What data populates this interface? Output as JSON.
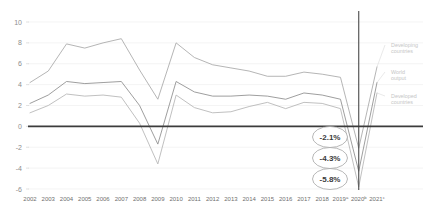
{
  "chart_data": {
    "type": "line",
    "title": "",
    "xlabel": "",
    "ylabel": "",
    "ylim": [
      -6,
      10
    ],
    "yticks": [
      10,
      8,
      6,
      4,
      2,
      0,
      -2,
      -4,
      -6
    ],
    "grid": true,
    "legend_position": "right",
    "categories": [
      "2002",
      "2003",
      "2004",
      "2005",
      "2006",
      "2007",
      "2008",
      "2009",
      "2010",
      "2011",
      "2012",
      "2013",
      "2014",
      "2015",
      "2016",
      "2017",
      "2018",
      "2019",
      "2020",
      "2021"
    ],
    "tick_labels": [
      "2002",
      "2003",
      "2004",
      "2005",
      "2006",
      "2007",
      "2008",
      "2009",
      "2010",
      "2011",
      "2012",
      "2013",
      "2014",
      "2015",
      "2016",
      "2017",
      "2018",
      "2019",
      "2020",
      "2021"
    ],
    "tick_superscripts": [
      "",
      "",
      "",
      "",
      "",
      "",
      "",
      "",
      "",
      "",
      "",
      "",
      "",
      "",
      "",
      "",
      "",
      "a",
      "b",
      "c"
    ],
    "series": [
      {
        "name": "Developing countries",
        "color": "#a8a8a8",
        "values": [
          4.2,
          5.3,
          7.9,
          7.5,
          8.0,
          8.4,
          5.4,
          2.6,
          8.0,
          6.6,
          5.9,
          5.6,
          5.3,
          4.8,
          4.8,
          5.2,
          5.0,
          4.7,
          -2.1,
          5.7
        ]
      },
      {
        "name": "World output",
        "color": "#8d8d8d",
        "values": [
          2.2,
          3.0,
          4.3,
          4.1,
          4.2,
          4.3,
          2.0,
          -1.7,
          4.3,
          3.3,
          2.9,
          2.9,
          3.0,
          2.9,
          2.6,
          3.2,
          3.0,
          2.6,
          -4.3,
          4.2
        ]
      },
      {
        "name": "Developed countries",
        "color": "#b5b5b5",
        "values": [
          1.3,
          2.0,
          3.1,
          2.9,
          3.0,
          2.8,
          0.3,
          -3.6,
          3.0,
          1.8,
          1.3,
          1.4,
          1.9,
          2.3,
          1.7,
          2.3,
          2.2,
          1.7,
          -5.8,
          3.2
        ]
      }
    ],
    "annotations": [
      {
        "label": "-2.1%",
        "series": "Developing countries",
        "year": "2020"
      },
      {
        "label": "-4.3%",
        "series": "World output",
        "year": "2020"
      },
      {
        "label": "-5.8%",
        "series": "Developed countries",
        "year": "2020"
      }
    ],
    "legend": [
      "Developing countries",
      "World output",
      "Developed countries"
    ],
    "forecast_divider_year": "2020"
  }
}
